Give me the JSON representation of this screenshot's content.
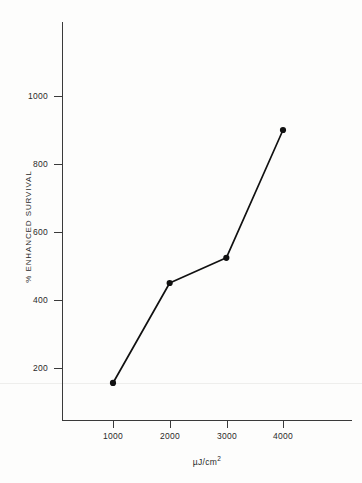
{
  "chart_data": {
    "type": "line",
    "title": "",
    "subtitle": "",
    "xlabel": "µJ/cm²",
    "ylabel": "% ENHANCED SURVIVAL",
    "x": [
      1000,
      2000,
      3000,
      4000
    ],
    "values": [
      156,
      450,
      524,
      900
    ],
    "series": [
      {
        "name": "% enhanced survival",
        "x": [
          1000,
          2000,
          3000,
          4000
        ],
        "values": [
          156,
          450,
          524,
          900
        ]
      }
    ],
    "xlim": [
      0,
      5100
    ],
    "ylim": [
      0,
      1230
    ],
    "xticks": [
      1000,
      2000,
      3000,
      4000
    ],
    "xtick_labels": [
      "1000",
      "2000",
      "3000",
      "4000"
    ],
    "yticks": [
      200,
      400,
      600,
      800,
      1000
    ],
    "ytick_labels": [
      "200",
      "400",
      "600",
      "800",
      "1000"
    ],
    "grid": false,
    "legend": null,
    "marker": "filled-circle",
    "line_color": "#111111",
    "marker_color": "#111111",
    "background_color": "#fdfdfc",
    "axis_color": "#3a3a3a"
  },
  "axis": {
    "x_title": "µJ/cm",
    "x_title_exponent": "2",
    "y_title": "% ENHANCED SURVIVAL"
  }
}
